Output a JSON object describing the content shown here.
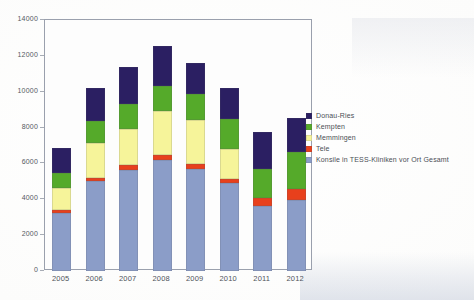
{
  "chart_data": {
    "type": "bar",
    "stacked": true,
    "title": "",
    "subtitle": "",
    "xlabel": "",
    "ylabel": "",
    "categories": [
      "2005",
      "2006",
      "2007",
      "2008",
      "2009",
      "2010",
      "2011",
      "2012"
    ],
    "ylim": [
      0,
      14000
    ],
    "ytick_values": [
      0,
      2000,
      4000,
      6000,
      8000,
      10000,
      12000,
      14000
    ],
    "ytick_labels": [
      "0",
      "2000",
      "4000",
      "6000",
      "8000",
      "10000",
      "12000",
      "14000"
    ],
    "grid": false,
    "legend_position": "right",
    "series": [
      {
        "name": "Konsile in TESS-Kliniken vor Ort Gesamt",
        "color": "#8b9dc8",
        "values": [
          3250,
          5000,
          5650,
          6200,
          5700,
          4900,
          3650,
          3950
        ]
      },
      {
        "name": "Tele",
        "color": "#e8401c",
        "values": [
          150,
          200,
          250,
          250,
          250,
          250,
          400,
          650
        ]
      },
      {
        "name": "Memmingen",
        "color": "#f6f49a",
        "values": [
          1250,
          1950,
          2050,
          2450,
          2500,
          1650,
          0,
          0
        ]
      },
      {
        "name": "Kempten",
        "color": "#55aa2a",
        "values": [
          800,
          1200,
          1350,
          1400,
          1400,
          1700,
          1650,
          2050
        ]
      },
      {
        "name": "Donau-Ries",
        "color": "#2b1f62",
        "values": [
          1400,
          1850,
          2100,
          2250,
          1750,
          1700,
          2050,
          1900
        ]
      }
    ],
    "totals": [
      6850,
      10200,
      11400,
      12550,
      11600,
      10200,
      7750,
      8550
    ]
  },
  "legend": {
    "items": [
      {
        "label": "Donau-Ries",
        "color": "#2b1f62"
      },
      {
        "label": "Kempten",
        "color": "#55aa2a"
      },
      {
        "label": "Memmingen",
        "color": "#f6f49a"
      },
      {
        "label": "Tele",
        "color": "#e8401c"
      },
      {
        "label": "Konsile in TESS-Kliniken vor Ort Gesamt",
        "color": "#8b9dc8"
      }
    ]
  },
  "colors": {
    "frame": "#9aa0ad",
    "plot_background": "#fdfdfd",
    "page_background": "#fbfbfa",
    "axis_text": "#55595f"
  }
}
